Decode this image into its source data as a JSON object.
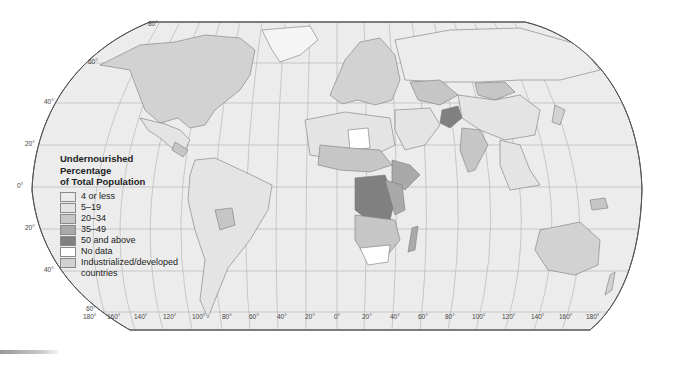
{
  "map": {
    "title_lines": [
      "Undernourished",
      "Percentage",
      "of Total Population"
    ],
    "projection": "Robinson",
    "colors": {
      "ocean": "#ececec",
      "graticule": "#b8b8b8",
      "border": "#7a7a7a",
      "frame": "#555555"
    },
    "legend": [
      {
        "label": "4 or less",
        "color": "#ececec"
      },
      {
        "label": "5–19",
        "color": "#e4e4e4"
      },
      {
        "label": "20–34",
        "color": "#c6c6c6"
      },
      {
        "label": "35–49",
        "color": "#a9a9a9"
      },
      {
        "label": "50 and above",
        "color": "#808080"
      },
      {
        "label": "No data",
        "color": "#ffffff"
      },
      {
        "label": "Industrialized/developed countries",
        "color": "#d2d2d2"
      }
    ],
    "latitude_labels": [
      {
        "text": "80°",
        "x": 148,
        "y": 26
      },
      {
        "text": "60°",
        "x": 88,
        "y": 63
      },
      {
        "text": "40°",
        "x": 44,
        "y": 103
      },
      {
        "text": "20°",
        "x": 25,
        "y": 145
      },
      {
        "text": "0°",
        "x": 17,
        "y": 187
      },
      {
        "text": "20°",
        "x": 25,
        "y": 229
      },
      {
        "text": "40°",
        "x": 44,
        "y": 271
      },
      {
        "text": "60°",
        "x": 86,
        "y": 310
      }
    ],
    "longitude_labels": [
      {
        "text": "180°",
        "x": 83
      },
      {
        "text": "160°",
        "x": 107
      },
      {
        "text": "140°",
        "x": 134
      },
      {
        "text": "120°",
        "x": 163
      },
      {
        "text": "100°",
        "x": 192
      },
      {
        "text": "80°",
        "x": 222
      },
      {
        "text": "60°",
        "x": 249
      },
      {
        "text": "40°",
        "x": 277
      },
      {
        "text": "20°",
        "x": 305
      },
      {
        "text": "0°",
        "x": 334
      },
      {
        "text": "20°",
        "x": 362
      },
      {
        "text": "40°",
        "x": 390
      },
      {
        "text": "60°",
        "x": 418
      },
      {
        "text": "80°",
        "x": 445
      },
      {
        "text": "100°",
        "x": 472
      },
      {
        "text": "120°",
        "x": 502
      },
      {
        "text": "140°",
        "x": 531
      },
      {
        "text": "160°",
        "x": 559
      },
      {
        "text": "180°",
        "x": 586
      }
    ]
  }
}
